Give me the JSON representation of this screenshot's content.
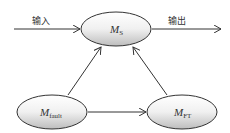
{
  "diagram": {
    "nodes": [
      {
        "id": "ms",
        "main": "M",
        "sub": "S"
      },
      {
        "id": "mfault",
        "main": "M",
        "sub": "fault"
      },
      {
        "id": "mft",
        "main": "M",
        "sub": "FT"
      }
    ],
    "edge_labels": {
      "input": "输入",
      "output": "输出"
    },
    "edges": [
      {
        "from": "input",
        "to": "ms"
      },
      {
        "from": "ms",
        "to": "output"
      },
      {
        "from": "mfault",
        "to": "ms"
      },
      {
        "from": "mft",
        "to": "ms"
      },
      {
        "from": "mfault",
        "to": "mft"
      }
    ]
  }
}
